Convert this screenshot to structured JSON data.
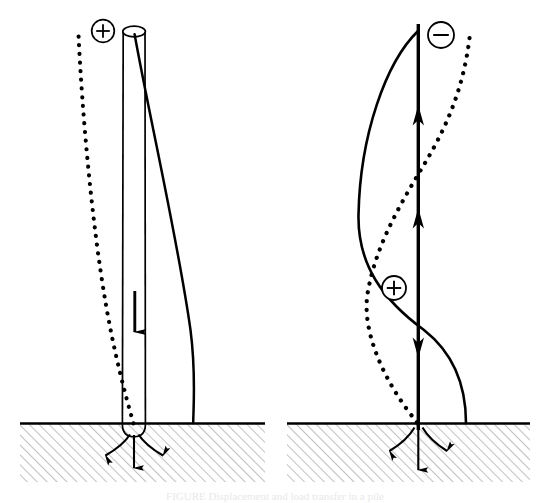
{
  "figure": {
    "caption_partial": "FIGURE   Displacement and load transfer in a pile",
    "background_color": "#ffffff",
    "line_color": "#000000",
    "hatch_color": "#b9b9b9",
    "ground_line_color": "#000000"
  },
  "panels": [
    {
      "id": "left-panel",
      "name": "compression-panel",
      "ground_label": "ground-surface",
      "symbols": [
        {
          "id": "left-plus",
          "glyph": "+",
          "name": "plus-sign-circle",
          "cx": 103,
          "cy": 31,
          "r": 11
        }
      ],
      "element_type": "pile-cylinder",
      "load_direction": "downward",
      "curves": [
        {
          "id": "left-solid-curve",
          "style": "solid",
          "name": "solid-deflection-curve"
        },
        {
          "id": "left-dotted-curve",
          "style": "dotted",
          "name": "dotted-deflection-curve"
        }
      ],
      "arrows": [
        {
          "id": "left-shaft-arrow",
          "direction": "down",
          "name": "shaft-load-arrow"
        },
        {
          "id": "left-tip-arrow",
          "direction": "down",
          "name": "tip-reaction-arrow"
        },
        {
          "id": "left-root-arrow-a",
          "direction": "down-left",
          "name": "soil-reaction-arrow-left"
        },
        {
          "id": "left-root-arrow-b",
          "direction": "down-right",
          "name": "soil-reaction-arrow-right"
        }
      ]
    },
    {
      "id": "right-panel",
      "name": "uplift-panel",
      "ground_label": "ground-surface",
      "symbols": [
        {
          "id": "right-minus",
          "glyph": "−",
          "name": "minus-sign-circle",
          "cx": 441,
          "cy": 35,
          "r": 13
        },
        {
          "id": "right-plus",
          "glyph": "+",
          "name": "plus-sign-circle",
          "cx": 394,
          "cy": 288,
          "r": 12
        }
      ],
      "element_type": "pile-line",
      "load_direction": "upward",
      "curves": [
        {
          "id": "right-solid-curve",
          "style": "solid",
          "name": "solid-deflection-curve"
        },
        {
          "id": "right-dotted-curve",
          "style": "dotted",
          "name": "dotted-deflection-curve"
        }
      ],
      "arrows": [
        {
          "id": "right-shaft-arrow-upper",
          "direction": "up",
          "name": "shaft-load-arrow-upper"
        },
        {
          "id": "right-shaft-arrow-lower",
          "direction": "up",
          "name": "shaft-load-arrow-lower"
        },
        {
          "id": "right-shaft-arrow-down",
          "direction": "down",
          "name": "shaft-load-arrow-down"
        },
        {
          "id": "right-tip-arrow",
          "direction": "down",
          "name": "tip-reaction-arrow"
        },
        {
          "id": "right-root-arrow-a",
          "direction": "down-left",
          "name": "soil-reaction-arrow-left"
        },
        {
          "id": "right-root-arrow-b",
          "direction": "down-right",
          "name": "soil-reaction-arrow-right"
        }
      ]
    }
  ]
}
